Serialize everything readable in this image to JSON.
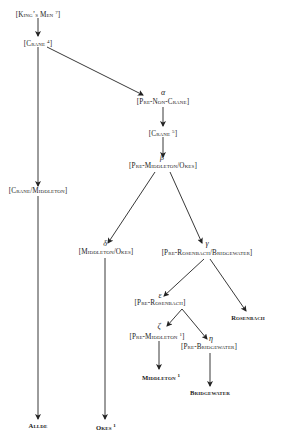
{
  "diagram": {
    "type": "stemma",
    "nodes": [
      {
        "id": "kings-men",
        "label": "[King’s Men ",
        "sup": "7",
        "]": "]",
        "greek": ""
      },
      {
        "id": "crane4",
        "label": "[Crane ",
        "sup": "4",
        "greek": ""
      },
      {
        "id": "crane-middleton",
        "label": "[Crane/Middleton]",
        "greek": ""
      },
      {
        "id": "pre-non-crane",
        "label": "[Pre-Non-Crane]",
        "greek": "α"
      },
      {
        "id": "crane5",
        "label": "[Crane ",
        "sup": "5",
        "greek": ""
      },
      {
        "id": "pre-middleton-okes",
        "label": "[Pre-Middleton/Okes]",
        "greek": "β"
      },
      {
        "id": "middleton-okes",
        "label": "[Middleton/Okes]",
        "greek": "δ"
      },
      {
        "id": "pre-rosenbach-bridgewater",
        "label": "[Pre-Rosenbach/Bridgewater]",
        "greek": "γ"
      },
      {
        "id": "rosenbach",
        "label": "Rosenbach",
        "greek": ""
      },
      {
        "id": "pre-rosenbach",
        "label": "[Pre-Rosenbach]",
        "greek": "ε"
      },
      {
        "id": "pre-middleton1",
        "label": "[Pre-Middleton ",
        "sup": "1",
        "greek": "ζ"
      },
      {
        "id": "pre-bridgewater",
        "label": "[Pre-Bridgewater]",
        "greek": "η"
      },
      {
        "id": "middleton1",
        "label": "Middleton ",
        "sup": "1",
        "greek": ""
      },
      {
        "id": "bridgewater",
        "label": "Bridgewater",
        "greek": ""
      },
      {
        "id": "allde",
        "label": "Allde",
        "greek": ""
      },
      {
        "id": "okes1",
        "label": "Okes ",
        "sup": "1",
        "greek": ""
      }
    ],
    "edges": [
      [
        "kings-men",
        "crane4"
      ],
      [
        "crane4",
        "crane-middleton"
      ],
      [
        "crane-middleton",
        "allde"
      ],
      [
        "crane4",
        "pre-non-crane"
      ],
      [
        "pre-non-crane",
        "crane5"
      ],
      [
        "crane5",
        "pre-middleton-okes"
      ],
      [
        "pre-middleton-okes",
        "middleton-okes"
      ],
      [
        "middleton-okes",
        "okes1"
      ],
      [
        "pre-middleton-okes",
        "pre-rosenbach-bridgewater"
      ],
      [
        "pre-rosenbach-bridgewater",
        "rosenbach"
      ],
      [
        "pre-rosenbach-bridgewater",
        "pre-rosenbach"
      ],
      [
        "pre-rosenbach",
        "pre-middleton1"
      ],
      [
        "pre-rosenbach",
        "pre-bridgewater"
      ],
      [
        "pre-middleton1",
        "middleton1"
      ],
      [
        "pre-bridgewater",
        "bridgewater"
      ]
    ]
  },
  "labels": {
    "kings_men": "[King’s Men",
    "kings_men_sup": "7",
    "crane4": "[Crane",
    "crane4_sup": "4",
    "crane_middleton": "[Crane/Middleton]",
    "alpha": "α",
    "pre_non_crane": "[Pre-Non-Crane]",
    "crane5": "[Crane",
    "crane5_sup": "5",
    "beta": "β",
    "pre_middleton_okes": "[Pre-Middleton/Okes]",
    "delta": "δ",
    "middleton_okes": "[Middleton/Okes]",
    "gamma": "γ",
    "pre_rosenbach_bridgewater": "[Pre-Rosenbach/Bridgewater]",
    "rosenbach": "Rosenbach",
    "epsilon": "ε",
    "pre_rosenbach": "[Pre-Rosenbach]",
    "zeta": "ζ",
    "pre_middleton1": "[Pre-Middleton",
    "pre_middleton1_sup": "1",
    "eta": "η",
    "pre_bridgewater": "[Pre-Bridgewater]",
    "middleton1": "Middleton",
    "middleton1_sup": "1",
    "bridgewater": "Bridgewater",
    "allde": "Allde",
    "okes1": "Okes",
    "okes1_sup": "1",
    "close_bracket": "]"
  }
}
